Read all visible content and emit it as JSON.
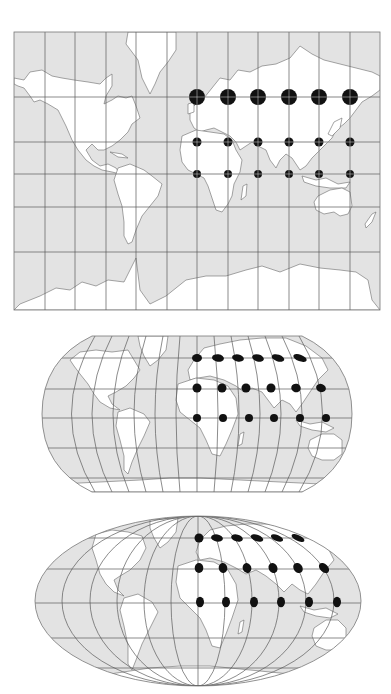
{
  "figure": {
    "panels": [
      {
        "id": "mercator",
        "projection": "Mercator (rectangular)",
        "frame": {
          "x": 14,
          "y": 32,
          "width": 366,
          "height": 278
        },
        "meridians_x": [
          14,
          45,
          75,
          106,
          136,
          167,
          197,
          228,
          258,
          289,
          319,
          350,
          380
        ],
        "parallels_y": [
          97,
          142,
          174,
          207,
          252
        ],
        "indicatrix": [
          {
            "row": "top",
            "y": 97,
            "r": 8,
            "x": [
              197,
              228,
              258,
              289,
              319,
              350
            ]
          },
          {
            "row": "middle",
            "y": 142,
            "r": 4.5,
            "x": [
              197,
              228,
              258,
              289,
              319,
              350
            ]
          },
          {
            "row": "bottom",
            "y": 174,
            "r": 4,
            "x": [
              197,
              228,
              258,
              289,
              319,
              350
            ]
          }
        ]
      },
      {
        "id": "robinson",
        "projection": "Robinson-like (pseudocylindrical, flat poles)",
        "center": {
          "x": 197,
          "y": 414
        },
        "extent": {
          "left": 42,
          "right": 352,
          "top": 336,
          "bottom": 492
        },
        "parallels_y": [
          358,
          389,
          418,
          448,
          478
        ],
        "indicatrix": [
          {
            "row": "top",
            "y": 358,
            "rx": 6,
            "ry": 4,
            "x": [
              197,
              218,
              238,
              258,
              278,
              300
            ]
          },
          {
            "row": "middle",
            "y": 388,
            "rx": 4.5,
            "ry": 4.5,
            "x": [
              197,
              222,
              246,
              271,
              296,
              321
            ]
          },
          {
            "row": "bottom",
            "y": 418,
            "rx": 4,
            "ry": 4,
            "x": [
              197,
              223,
              249,
              274,
              300,
              326
            ]
          }
        ]
      },
      {
        "id": "mollweide",
        "projection": "Mollweide (elliptical)",
        "center": {
          "x": 198,
          "y": 603
        },
        "extent": {
          "left": 35,
          "right": 362,
          "top": 516,
          "bottom": 686
        },
        "parallels_y": [
          538,
          569,
          603,
          638,
          668
        ],
        "indicatrix": [
          {
            "row": "top",
            "y": 538,
            "rx": 6.5,
            "ry": 3.5,
            "x": [
              199,
              217,
              237,
              257,
              277,
              298
            ]
          },
          {
            "row": "middle",
            "y": 568,
            "rx": 4.5,
            "ry": 5,
            "x": [
              199,
              223,
              247,
              273,
              298,
              324
            ]
          },
          {
            "row": "bottom",
            "y": 602,
            "rx": 4,
            "ry": 5,
            "x": [
              200,
              226,
              254,
              281,
              309,
              337
            ]
          }
        ]
      }
    ],
    "colors": {
      "ocean": "#e3e3e3",
      "land": "#ffffff",
      "grid": "#5a5a5a",
      "indicatrix": "#111111"
    }
  }
}
